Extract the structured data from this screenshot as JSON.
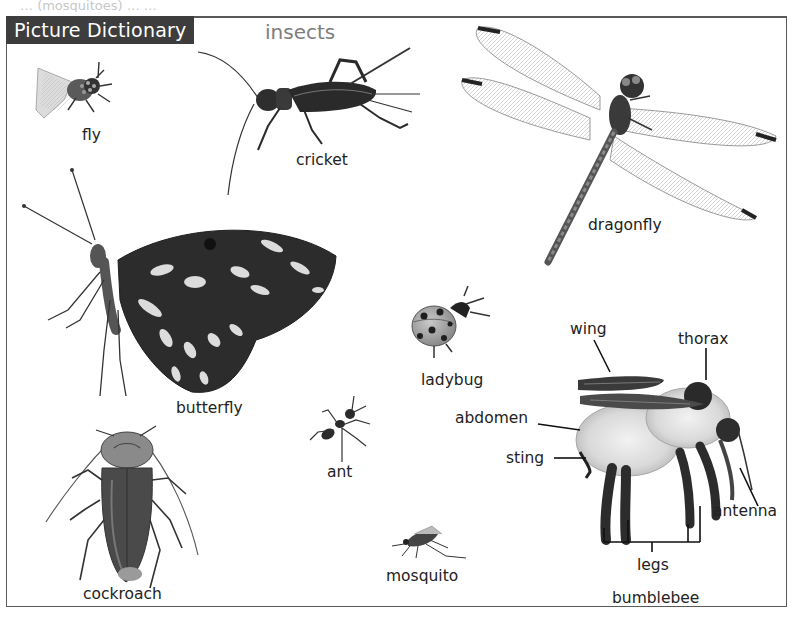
{
  "header": {
    "title": "Picture Dictionary",
    "topic": "insects",
    "bleed_through_text": "… (mosquitoes) … …"
  },
  "colors": {
    "title_bg": "#3d3d3d",
    "title_fg": "#ffffff",
    "topic_fg": "#7d7d7d",
    "frame": "#5a5a5a",
    "label": "#222222"
  },
  "insects": [
    {
      "id": "fly",
      "label": "fly"
    },
    {
      "id": "cricket",
      "label": "cricket"
    },
    {
      "id": "dragonfly",
      "label": "dragonfly"
    },
    {
      "id": "butterfly",
      "label": "butterfly"
    },
    {
      "id": "ladybug",
      "label": "ladybug"
    },
    {
      "id": "ant",
      "label": "ant"
    },
    {
      "id": "cockroach",
      "label": "cockroach"
    },
    {
      "id": "mosquito",
      "label": "mosquito"
    },
    {
      "id": "bumblebee",
      "label": "bumblebee"
    }
  ],
  "bumblebee_parts": {
    "wing": "wing",
    "thorax": "thorax",
    "abdomen": "abdomen",
    "sting": "sting",
    "antenna": "antenna",
    "legs": "legs"
  }
}
